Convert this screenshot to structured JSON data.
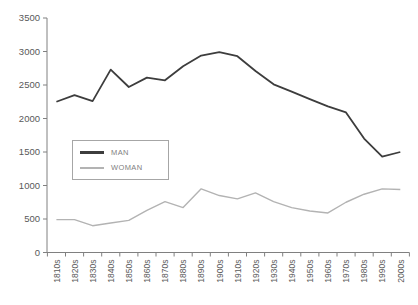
{
  "chart_data": {
    "type": "line",
    "title": "",
    "xlabel": "",
    "ylabel": "",
    "categories": [
      "1810s",
      "1820s",
      "1830s",
      "1840s",
      "1850s",
      "1860s",
      "1870s",
      "1880s",
      "1890s",
      "1900s",
      "1910s",
      "1920s",
      "1930s",
      "1940s",
      "1950s",
      "1960s",
      "1970s",
      "1980s",
      "1990s",
      "2000s"
    ],
    "series": [
      {
        "name": "MAN",
        "color": "#3d3d3d",
        "stroke_width": 1.8,
        "values": [
          2250,
          2350,
          2260,
          2730,
          2470,
          2610,
          2570,
          2780,
          2940,
          2990,
          2930,
          2710,
          2510,
          2400,
          2290,
          2180,
          2090,
          1700,
          1430,
          1500
        ]
      },
      {
        "name": "WOMAN",
        "color": "#b3b3b3",
        "stroke_width": 1.4,
        "values": [
          490,
          490,
          400,
          440,
          480,
          630,
          760,
          670,
          950,
          850,
          800,
          890,
          760,
          670,
          620,
          590,
          750,
          870,
          950,
          940
        ]
      }
    ],
    "ylim": [
      0,
      3500
    ],
    "y_ticks": [
      0,
      500,
      1000,
      1500,
      2000,
      2500,
      3000,
      3500
    ],
    "grid": false,
    "legend_position": "middle-left",
    "axis_color": "#808080",
    "tick_label_color": "#595959"
  }
}
